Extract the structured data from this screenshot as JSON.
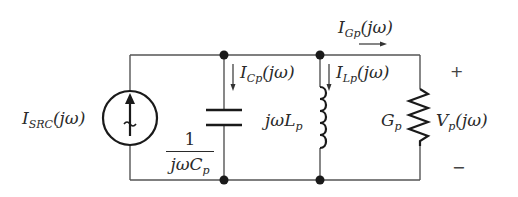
{
  "diagram": {
    "type": "parallel-RLC-circuit",
    "source": {
      "label_main": "I",
      "label_sub": "SRC",
      "label_arg": "(jω)",
      "icon": "current-source-arrow-up"
    },
    "capacitor": {
      "current_main": "I",
      "current_sub": "Cp",
      "current_arg": "(jω)",
      "impedance_num": "1",
      "impedance_den_main": "jωC",
      "impedance_den_sub": "p"
    },
    "inductor": {
      "current_main": "I",
      "current_sub": "Lp",
      "current_arg": "(jω)",
      "impedance_main": "jωL",
      "impedance_sub": "p"
    },
    "resistor": {
      "current_main": "I",
      "current_sub": "Gp",
      "current_arg": "(jω)",
      "conductance_main": "G",
      "conductance_sub": "p"
    },
    "voltage": {
      "main": "V",
      "sub": "p",
      "arg": "(jω)",
      "plus": "+",
      "minus": "−"
    },
    "colors": {
      "wire": "#555555",
      "component": "#1a1a1a",
      "text": "#2a2a2a",
      "background": "#ffffff"
    }
  }
}
